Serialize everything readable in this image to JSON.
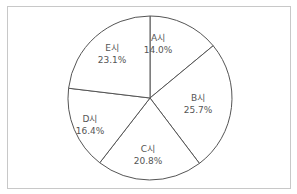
{
  "chart_data": {
    "type": "pie",
    "title": "",
    "categories": [
      "A시",
      "B시",
      "C시",
      "D시",
      "E시"
    ],
    "values": [
      14.0,
      25.7,
      20.8,
      16.4,
      23.1
    ],
    "unit": "%",
    "start_angle_deg": 0,
    "direction": "clockwise",
    "labels": [
      {
        "name": "A시",
        "value": "14.0%"
      },
      {
        "name": "B시",
        "value": "25.7%"
      },
      {
        "name": "C시",
        "value": "20.8%"
      },
      {
        "name": "D시",
        "value": "16.4%"
      },
      {
        "name": "E시",
        "value": "23.1%"
      }
    ],
    "legend": "none",
    "fill": "#ffffff",
    "stroke": "#555555"
  }
}
